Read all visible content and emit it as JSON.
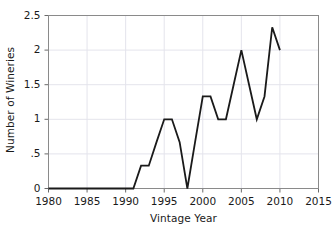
{
  "chart_data": {
    "type": "line",
    "title": "",
    "xlabel": "Vintage Year",
    "ylabel": "Number of Wineries",
    "xlim": [
      1980,
      2015
    ],
    "ylim": [
      0,
      2.5
    ],
    "grid": true,
    "legend": null,
    "xticks": [
      1980,
      1985,
      1990,
      1995,
      2000,
      2005,
      2010,
      2015
    ],
    "xtick_labels": [
      "1980",
      "1985",
      "1990",
      "1995",
      "2000",
      "2005",
      "2010",
      "2015"
    ],
    "yticks": [
      0,
      0.5,
      1,
      1.5,
      2,
      2.5
    ],
    "ytick_labels": [
      "0",
      ".5",
      "1",
      "1.5",
      "2",
      "2.5"
    ],
    "line_color": "#1a1a1a",
    "line_width": 1.8,
    "x": [
      1980,
      1981,
      1982,
      1983,
      1984,
      1985,
      1986,
      1987,
      1988,
      1989,
      1990,
      1991,
      1992,
      1993,
      1994,
      1995,
      1996,
      1997,
      1998,
      1999,
      2000,
      2001,
      2002,
      2003,
      2004,
      2005,
      2006,
      2007,
      2008,
      2009,
      2010
    ],
    "values": [
      0,
      0,
      0,
      0,
      0,
      0,
      0,
      0,
      0,
      0,
      0,
      0,
      0.33,
      0.33,
      0.67,
      1,
      1,
      0.67,
      0,
      0.67,
      1.33,
      1.33,
      1,
      1,
      1.5,
      2,
      1.5,
      1,
      1.33,
      2.33,
      2
    ]
  }
}
